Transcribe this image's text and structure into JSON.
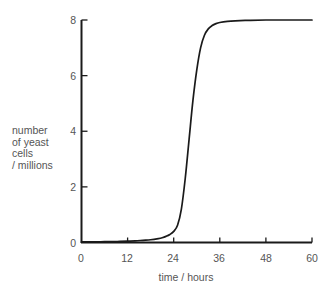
{
  "chart_data": {
    "type": "line",
    "title": "",
    "subtitle": "",
    "xlabel": "time / hours",
    "ylabel": "number of yeast cells / millions",
    "ylabel_lines": [
      "number",
      "of yeast",
      "cells",
      "/ millions"
    ],
    "xlim": [
      0,
      60
    ],
    "ylim": [
      0,
      8
    ],
    "xticks": [
      0,
      12,
      24,
      36,
      48,
      60
    ],
    "yticks": [
      0,
      2,
      4,
      6,
      8
    ],
    "xtick_labels": [
      "0",
      "12",
      "24",
      "36",
      "48",
      "60"
    ],
    "ytick_labels": [
      "0",
      "2",
      "4",
      "6",
      "8"
    ],
    "grid": false,
    "legend": false,
    "legend_position": "none",
    "line_color": "#1a1a1a",
    "series": [
      {
        "name": "yeast population",
        "x": [
          0,
          2,
          4,
          6,
          8,
          10,
          12,
          14,
          16,
          18,
          20,
          21,
          22,
          23,
          24,
          25,
          26,
          27,
          28,
          29,
          30,
          31,
          32,
          33,
          34,
          35,
          36,
          38,
          40,
          44,
          48,
          52,
          56,
          60
        ],
        "values": [
          0.02,
          0.02,
          0.02,
          0.03,
          0.03,
          0.04,
          0.05,
          0.06,
          0.08,
          0.1,
          0.14,
          0.17,
          0.22,
          0.29,
          0.4,
          0.62,
          1.2,
          2.3,
          3.7,
          5.1,
          6.2,
          7.0,
          7.45,
          7.68,
          7.8,
          7.87,
          7.91,
          7.95,
          7.97,
          7.99,
          8.0,
          8.0,
          8.0,
          8.0
        ]
      }
    ],
    "annotations": []
  },
  "axis": {
    "color": "#1a1a1a"
  },
  "footer": {
    "clipped_text": ""
  }
}
